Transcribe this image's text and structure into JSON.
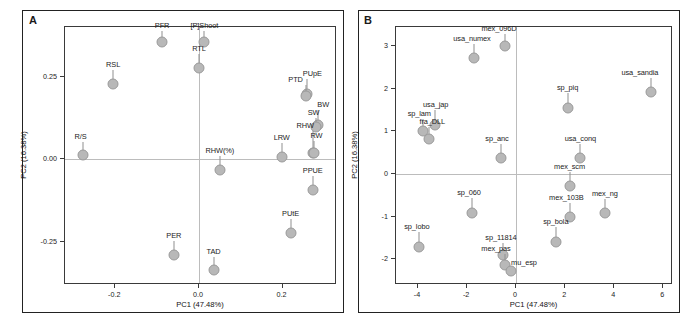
{
  "figure": {
    "panel_a_letter": "A",
    "panel_b_letter": "B"
  },
  "chart_data": [
    {
      "type": "scatter",
      "title": "",
      "panel": "A",
      "xlabel": "PC1 (47.48%)",
      "ylabel": "PC2 (16.38%)",
      "xlim": [
        -0.32,
        0.33
      ],
      "ylim": [
        -0.38,
        0.4
      ],
      "xticks": [
        -0.2,
        0.0,
        0.2
      ],
      "xticklabels": [
        "-0.2",
        "0.0",
        "0.2"
      ],
      "yticks": [
        0.25,
        0.0,
        -0.25
      ],
      "yticklabels": [
        "0.25",
        "0.00",
        "-0.25"
      ],
      "grid": false,
      "zero_lines": true,
      "legend": "none",
      "points": [
        {
          "label": "PFR",
          "x": -0.088,
          "y": 0.355,
          "lx": -0.088,
          "ly": 0.392
        },
        {
          "label": "[P]Shoot",
          "x": 0.013,
          "y": 0.355,
          "lx": 0.013,
          "ly": 0.392
        },
        {
          "label": "RTL",
          "x": 0.0,
          "y": 0.277,
          "lx": 0.0,
          "ly": 0.322
        },
        {
          "label": "RSL",
          "x": -0.205,
          "y": 0.228,
          "lx": -0.205,
          "ly": 0.272
        },
        {
          "label": "PUpE",
          "x": 0.258,
          "y": 0.196,
          "lx": 0.271,
          "ly": 0.245
        },
        {
          "label": "PTD",
          "x": 0.255,
          "y": 0.192,
          "lx": 0.231,
          "ly": 0.228
        },
        {
          "label": "BW",
          "x": 0.285,
          "y": 0.105,
          "lx": 0.297,
          "ly": 0.152
        },
        {
          "label": "SW",
          "x": 0.281,
          "y": 0.098,
          "lx": 0.274,
          "ly": 0.128
        },
        {
          "label": "R/S",
          "x": -0.277,
          "y": 0.012,
          "lx": -0.283,
          "ly": 0.055
        },
        {
          "label": "RHW",
          "x": 0.272,
          "y": 0.02,
          "lx": 0.254,
          "ly": 0.088
        },
        {
          "label": "RW",
          "x": 0.276,
          "y": 0.018,
          "lx": 0.281,
          "ly": 0.058
        },
        {
          "label": "LRW",
          "x": 0.198,
          "y": 0.008,
          "lx": 0.198,
          "ly": 0.052
        },
        {
          "label": "RHW(%)",
          "x": 0.05,
          "y": -0.032,
          "lx": 0.05,
          "ly": 0.012
        },
        {
          "label": "PPUE",
          "x": 0.272,
          "y": -0.092,
          "lx": 0.272,
          "ly": -0.048
        },
        {
          "label": "PUtE",
          "x": 0.219,
          "y": -0.223,
          "lx": 0.219,
          "ly": -0.178
        },
        {
          "label": "PER",
          "x": -0.06,
          "y": -0.29,
          "lx": -0.06,
          "ly": -0.245
        },
        {
          "label": "TAD",
          "x": 0.035,
          "y": -0.335,
          "lx": 0.035,
          "ly": -0.292
        }
      ]
    },
    {
      "type": "scatter",
      "title": "",
      "panel": "B",
      "xlabel": "PC1 (47.48%)",
      "ylabel": "PC2 (16.38%)",
      "xlim": [
        -4.9,
        6.4
      ],
      "ylim": [
        -2.6,
        3.45
      ],
      "xticks": [
        -4,
        -2,
        0,
        2,
        4,
        6
      ],
      "xticklabels": [
        "-4",
        "-2",
        "0",
        "2",
        "4",
        "6"
      ],
      "yticks": [
        3,
        2,
        1,
        0,
        -1,
        -2
      ],
      "yticklabels": [
        "3",
        "2",
        "1",
        "0",
        "-1",
        "-2"
      ],
      "grid": false,
      "zero_lines": true,
      "legend": "none",
      "points": [
        {
          "label": "mex_096D",
          "x": -0.45,
          "y": 3.0,
          "lx": -0.7,
          "ly": 3.3
        },
        {
          "label": "usa_numex",
          "x": -1.7,
          "y": 2.72,
          "lx": -1.8,
          "ly": 3.08
        },
        {
          "label": "usa_sandia",
          "x": 5.5,
          "y": 1.92,
          "lx": 5.05,
          "ly": 2.28
        },
        {
          "label": "sp_piq",
          "x": 2.1,
          "y": 1.55,
          "lx": 2.1,
          "ly": 1.92
        },
        {
          "label": "usa_jap",
          "x": -3.3,
          "y": 1.15,
          "lx": -3.28,
          "ly": 1.52
        },
        {
          "label": "sp_lam",
          "x": -3.78,
          "y": 1.02,
          "lx": -3.95,
          "ly": 1.32
        },
        {
          "label": "fra_DLL",
          "x": -3.55,
          "y": 0.82,
          "lx": -3.42,
          "ly": 1.14
        },
        {
          "label": "sp_anc",
          "x": -0.62,
          "y": 0.38,
          "lx": -0.78,
          "ly": 0.72
        },
        {
          "label": "usa_conq",
          "x": 2.62,
          "y": 0.38,
          "lx": 2.62,
          "ly": 0.74
        },
        {
          "label": "mex_scm",
          "x": 2.18,
          "y": -0.28,
          "lx": 2.18,
          "ly": 0.08
        },
        {
          "label": "sp_060",
          "x": -1.82,
          "y": -0.9,
          "lx": -1.92,
          "ly": -0.54
        },
        {
          "label": "mex_103B",
          "x": 2.2,
          "y": -1.0,
          "lx": 2.05,
          "ly": -0.66
        },
        {
          "label": "mex_ng",
          "x": 3.62,
          "y": -0.92,
          "lx": 3.62,
          "ly": -0.56
        },
        {
          "label": "sp_bola",
          "x": 1.62,
          "y": -1.58,
          "lx": 1.62,
          "ly": -1.22
        },
        {
          "label": "sp_lobo",
          "x": -3.95,
          "y": -1.7,
          "lx": -4.05,
          "ly": -1.34
        },
        {
          "label": "sp_11814",
          "x": -0.52,
          "y": -1.9,
          "lx": -0.62,
          "ly": -1.58
        },
        {
          "label": "mex_pas",
          "x": -0.45,
          "y": -2.12,
          "lx": -0.82,
          "ly": -1.86
        },
        {
          "label": "mu_esp",
          "x": -0.2,
          "y": -2.26,
          "lx": 0.32,
          "ly": -2.18
        }
      ]
    }
  ]
}
